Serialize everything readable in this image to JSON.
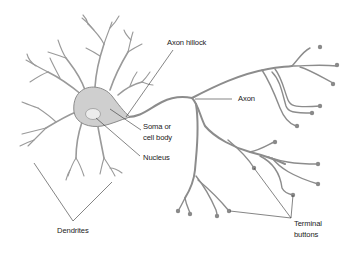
{
  "diagram": {
    "colors": {
      "background": "#ffffff",
      "soma_fill": "#cfcfcf",
      "soma_stroke": "#8c8c8c",
      "nucleus_fill": "#ececec",
      "process_stroke": "#8c8c8c",
      "label_text": "#222222",
      "leader_line": "#333333"
    },
    "labels": {
      "axon_hillock": "Axon hillock",
      "axon": "Axon",
      "soma_line1": "Soma or",
      "soma_line2": "cell body",
      "nucleus": "Nucleus",
      "dendrites": "Dendrites",
      "terminal_line1": "Terminal",
      "terminal_line2": "buttons"
    },
    "parts": [
      {
        "name": "Dendrites",
        "description": "branching processes around cell body"
      },
      {
        "name": "Soma or cell body",
        "description": "shaded teardrop-shaped body"
      },
      {
        "name": "Nucleus",
        "description": "light oval inside soma"
      },
      {
        "name": "Axon hillock",
        "description": "tapering point where axon leaves soma"
      },
      {
        "name": "Axon",
        "description": "long process branching to the right"
      },
      {
        "name": "Terminal buttons",
        "description": "round knobs at axon branch ends"
      }
    ]
  }
}
